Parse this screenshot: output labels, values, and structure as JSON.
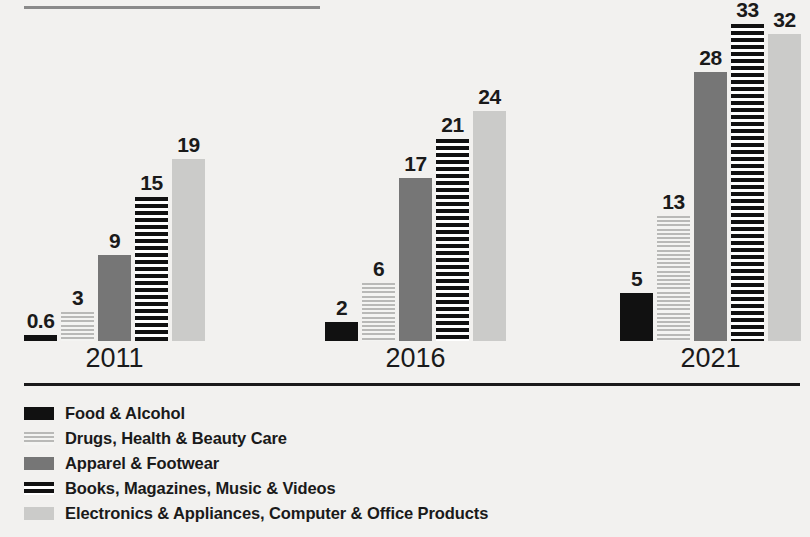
{
  "chart_data": {
    "type": "bar",
    "title": "",
    "subtitle": "",
    "xlabel": "",
    "ylabel": "",
    "categories": [
      "2011",
      "2016",
      "2021"
    ],
    "series": [
      {
        "name": "Food & Alcohol",
        "pattern": "solid-black",
        "color": "#111111",
        "values": [
          0.6,
          2,
          5
        ],
        "labels": [
          "0.6",
          "2",
          "5"
        ]
      },
      {
        "name": "Drugs, Health & Beauty Care",
        "pattern": "fine-light-stripes",
        "color": "#b9b9b7",
        "values": [
          3,
          6,
          13
        ],
        "labels": [
          "3",
          "6",
          "13"
        ]
      },
      {
        "name": "Apparel & Footwear",
        "pattern": "solid-medium-gray",
        "color": "#767676",
        "values": [
          9,
          17,
          28
        ],
        "labels": [
          "9",
          "17",
          "28"
        ]
      },
      {
        "name": "Books, Magazines, Music & Videos",
        "pattern": "bold-black-stripes",
        "color": "#111111",
        "values": [
          15,
          21,
          33
        ],
        "labels": [
          "15",
          "21",
          "33"
        ]
      },
      {
        "name": "Electronics & Appliances, Computer & Office Products",
        "pattern": "solid-light-gray",
        "color": "#cbcbc9",
        "values": [
          19,
          24,
          32
        ],
        "labels": [
          "19",
          "24",
          "32"
        ]
      }
    ],
    "ylim": [
      0,
      33
    ],
    "grid": false,
    "legend_position": "bottom-left",
    "axis_visible": false
  },
  "legend": {
    "items": [
      {
        "label": "Food & Alcohol",
        "swatch": "solid-black-swatch"
      },
      {
        "label": "Drugs, Health & Beauty Care",
        "swatch": "fine-light-stripes-swatch"
      },
      {
        "label": "Apparel & Footwear",
        "swatch": "solid-medium-gray-swatch"
      },
      {
        "label": "Books, Magazines, Music & Videos",
        "swatch": "bold-black-stripes-swatch"
      },
      {
        "label": "Electronics & Appliances, Computer & Office Products",
        "swatch": "solid-light-gray-swatch"
      }
    ]
  },
  "rules": {
    "top_rule_color": "#8a8a8a",
    "divider_color": "#1a1a1a"
  },
  "background_color": "#f2f1ef"
}
